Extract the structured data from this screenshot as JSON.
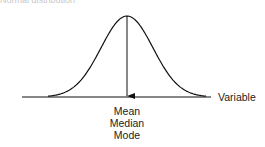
{
  "title": "Normal distribution",
  "diagram": {
    "axis_label": "Variable",
    "center_labels": [
      "Mean",
      "Median",
      "Mode"
    ],
    "curve": "bell-shaped normal curve",
    "arrow": "down-arrow from peak to axis"
  }
}
